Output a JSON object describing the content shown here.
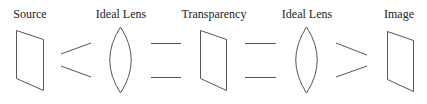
{
  "diagram": {
    "stroke_color": "#555555",
    "text_color": "#222222",
    "labels": [
      {
        "text": "Source",
        "cx": 30
      },
      {
        "text": "Ideal Lens",
        "cx": 121
      },
      {
        "text": "Transparency",
        "cx": 214
      },
      {
        "text": "Ideal Lens",
        "cx": 307
      },
      {
        "text": "Image",
        "cx": 399
      }
    ],
    "elements": [
      {
        "type": "plane",
        "name": "source-plane"
      },
      {
        "type": "converging-rays",
        "name": "rays-diverging"
      },
      {
        "type": "lens",
        "name": "ideal-lens-1"
      },
      {
        "type": "parallel-rays",
        "name": "rays-parallel-1"
      },
      {
        "type": "plane",
        "name": "transparency-plane"
      },
      {
        "type": "parallel-rays",
        "name": "rays-parallel-2"
      },
      {
        "type": "lens",
        "name": "ideal-lens-2"
      },
      {
        "type": "converging-rays",
        "name": "rays-converging"
      },
      {
        "type": "plane",
        "name": "image-plane"
      }
    ]
  }
}
